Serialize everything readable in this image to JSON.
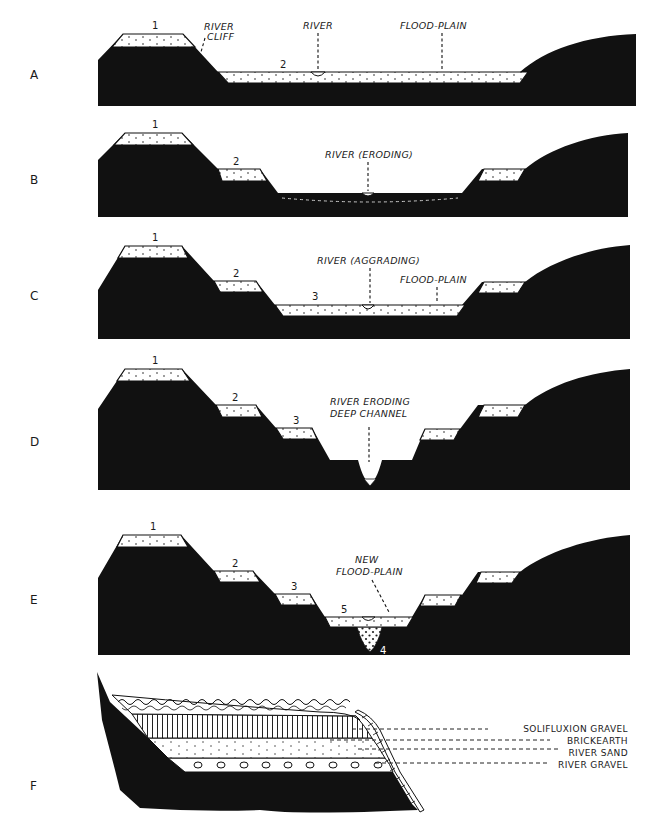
{
  "figure": {
    "type": "geological cross-section diagram",
    "panels": [
      {
        "letter": "A",
        "labels": {
          "terrace_1": "1",
          "terrace_2": "2",
          "river_cliff": "RIVER CLIFF",
          "river": "RIVER",
          "flood_plain": "FLOOD-PLAIN"
        }
      },
      {
        "letter": "B",
        "labels": {
          "terrace_1": "1",
          "terrace_2": "2",
          "river": "RIVER (ERODING)"
        }
      },
      {
        "letter": "C",
        "labels": {
          "terrace_1": "1",
          "terrace_2": "2",
          "terrace_3": "3",
          "river": "RIVER (AGGRADING)",
          "flood_plain": "FLOOD-PLAIN"
        }
      },
      {
        "letter": "D",
        "labels": {
          "terrace_1": "1",
          "terrace_2": "2",
          "terrace_3": "3",
          "river_line1": "RIVER ERODING",
          "river_line2": "DEEP CHANNEL"
        }
      },
      {
        "letter": "E",
        "labels": {
          "terrace_1": "1",
          "terrace_2": "2",
          "terrace_3": "3",
          "gravel_4": "4",
          "floodplain_5": "5",
          "new_line1": "NEW",
          "new_line2": "FLOOD-PLAIN"
        }
      },
      {
        "letter": "F",
        "legend": [
          "SOLIFLUXION GRAVEL",
          "BRICKEARTH",
          "RIVER SAND",
          "RIVER GRAVEL"
        ]
      }
    ],
    "colors": {
      "bedrock": "#111111",
      "deposit": "#ffffff",
      "background": "#ffffff"
    }
  }
}
